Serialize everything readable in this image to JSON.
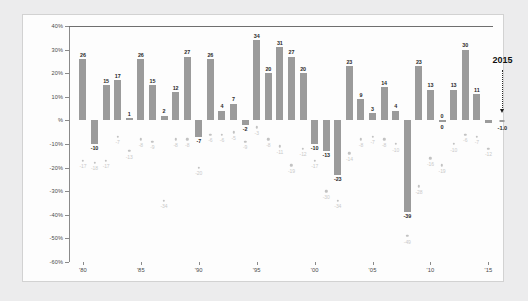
{
  "chart_data": {
    "type": "bar",
    "title": "",
    "subtitle": "",
    "xlabel": "",
    "ylabel": "",
    "ylim": [
      -60,
      40
    ],
    "grid": false,
    "legend_position": "none",
    "ytick_labels": [
      "40%",
      "30%",
      "20%",
      "10%",
      "%",
      "-10%",
      "-20%",
      "-30%",
      "-40%",
      "-50%",
      "-60%"
    ],
    "ytick_values": [
      40,
      30,
      20,
      10,
      0,
      -10,
      -20,
      -30,
      -40,
      -50,
      -60
    ],
    "xtick_labels": [
      "'80",
      "'85",
      "'90",
      "'95",
      "'00",
      "'05",
      "'10",
      "'15"
    ],
    "xtick_years": [
      1980,
      1985,
      1990,
      1995,
      2000,
      2005,
      2010,
      2015
    ],
    "x": [
      1980,
      1981,
      1982,
      1983,
      1984,
      1985,
      1986,
      1987,
      1988,
      1989,
      1990,
      1991,
      1992,
      1993,
      1994,
      1995,
      1996,
      1997,
      1998,
      1999,
      2000,
      2001,
      2002,
      2003,
      2004,
      2005,
      2006,
      2007,
      2008,
      2009,
      2010,
      2011,
      2012,
      2013,
      2014,
      2015
    ],
    "series": [
      {
        "name": "Annual return",
        "type": "bar",
        "values": [
          26,
          -10,
          15,
          17,
          1,
          26,
          15,
          2,
          12,
          27,
          -7,
          26,
          4,
          7,
          -2,
          34,
          20,
          31,
          27,
          20,
          -10,
          -13,
          -23,
          23,
          9,
          3,
          14,
          4,
          -39,
          23,
          13,
          0,
          13,
          30,
          11,
          -1.0
        ],
        "labels": [
          "26",
          "-10",
          "15",
          "17",
          "1",
          "26",
          "15",
          "2",
          "12",
          "27",
          "-7",
          "26",
          "4",
          "7",
          "-2",
          "34",
          "20",
          "31",
          "27",
          "20",
          "-10",
          "-13",
          "-23",
          "23",
          "9",
          "3",
          "14",
          "4",
          "-39",
          "23",
          "13",
          "0",
          "13",
          "30",
          "11",
          ""
        ]
      },
      {
        "name": "Max intra-year decline",
        "type": "scatter",
        "values": [
          -17,
          -18,
          -17,
          -7,
          -13,
          -8,
          -9,
          -34,
          -8,
          -8,
          -20,
          -6,
          -6,
          -5,
          -9,
          -3,
          -8,
          -11,
          -19,
          -12,
          -17,
          -30,
          -34,
          -14,
          -8,
          -7,
          -8,
          -10,
          -49,
          -28,
          -16,
          -19,
          -10,
          -6,
          -7,
          -12
        ],
        "labels": [
          "-17",
          "-18",
          "-17",
          "-7",
          "-13",
          "-8",
          "-9",
          "-34",
          "-8",
          "-8",
          "-20",
          "-6",
          "-6",
          "-5",
          "-9",
          "-3",
          "-8",
          "-11",
          "-19",
          "-12",
          "-17",
          "-30",
          "-34",
          "-14",
          "-8",
          "-7",
          "-8",
          "-10",
          "-49",
          "-28",
          "-16",
          "-19",
          "-10",
          "-6",
          "-7",
          "-12"
        ]
      }
    ],
    "annotations": [
      {
        "name": "year-callout",
        "text": "2015",
        "year": 2015
      },
      {
        "name": "callout-value",
        "text": "-1.0",
        "value": -1.0
      },
      {
        "name": "zero-label-2011",
        "text": "0",
        "year": 2011
      }
    ],
    "colors": {
      "bar": "#9b9b9b",
      "scatter": "#c2c2c2",
      "scatter_label": "#c9c9c9",
      "bar_label": "#2a2a2a",
      "axis": "#8a8a8a",
      "panel_background": "#fdfdfd",
      "page_background": "#ececed",
      "panel_border": "#d2d2d2"
    }
  }
}
